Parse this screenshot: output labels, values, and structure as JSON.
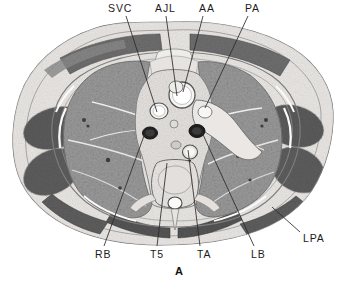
{
  "figure": {
    "letter": "A",
    "caption_letter_name": "figure-panel-letter",
    "background_color": "#ffffff",
    "line_color": "#2a2a2a",
    "text_color": "#1b1b1b",
    "width": 348,
    "height": 284
  },
  "image": {
    "kind": "axial-thoracic-anatomical-cross-section",
    "description": "Grayscale axial cross-section of the thorax showing lungs, mediastinum, vertebra, ribs and scapular muscles"
  },
  "labels": [
    {
      "id": "svc",
      "text": "SVC",
      "meaning": "superior vena cava",
      "position": "top",
      "label_x": 108,
      "label_y": 3,
      "leader": {
        "x1": 126,
        "y1": 16,
        "x2": 157,
        "y2": 112
      }
    },
    {
      "id": "ajl",
      "text": "AJL",
      "meaning": "azygos junction / left brachiocephalic level",
      "position": "top",
      "label_x": 155,
      "label_y": 3,
      "leader": {
        "x1": 166,
        "y1": 16,
        "x2": 177,
        "y2": 96
      }
    },
    {
      "id": "aa",
      "text": "AA",
      "meaning": "ascending aorta",
      "position": "top",
      "label_x": 199,
      "label_y": 3,
      "leader": {
        "x1": 203,
        "y1": 16,
        "x2": 183,
        "y2": 92
      }
    },
    {
      "id": "pa",
      "text": "PA",
      "meaning": "pulmonary artery",
      "position": "top",
      "label_x": 245,
      "label_y": 3,
      "leader": {
        "x1": 248,
        "y1": 16,
        "x2": 205,
        "y2": 108
      }
    },
    {
      "id": "rb",
      "text": "RB",
      "meaning": "right bronchus",
      "position": "bottom",
      "label_x": 95,
      "label_y": 249,
      "leader": {
        "x1": 104,
        "y1": 246,
        "x2": 145,
        "y2": 133
      }
    },
    {
      "id": "t5",
      "text": "T5",
      "meaning": "fifth thoracic vertebra",
      "position": "bottom",
      "label_x": 150,
      "label_y": 249,
      "leader": {
        "x1": 157,
        "y1": 246,
        "x2": 167,
        "y2": 163
      }
    },
    {
      "id": "ta",
      "text": "TA",
      "meaning": "thoracic aorta",
      "position": "bottom",
      "label_x": 197,
      "label_y": 249,
      "leader": {
        "x1": 200,
        "y1": 246,
        "x2": 188,
        "y2": 150
      }
    },
    {
      "id": "lb",
      "text": "LB",
      "meaning": "left bronchus",
      "position": "bottom",
      "label_x": 251,
      "label_y": 249,
      "leader": {
        "x1": 254,
        "y1": 246,
        "x2": 200,
        "y2": 128
      }
    },
    {
      "id": "lpa",
      "text": "LPA",
      "meaning": "left pulmonary artery",
      "position": "right",
      "label_x": 303,
      "label_y": 233,
      "leader": {
        "x1": 300,
        "y1": 232,
        "x2": 272,
        "y2": 207
      }
    }
  ]
}
